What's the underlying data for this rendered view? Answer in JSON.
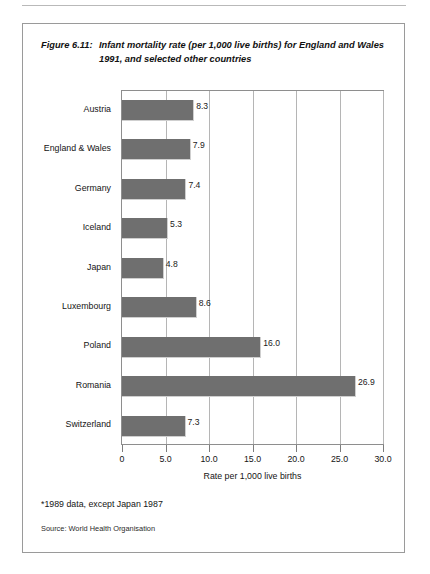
{
  "figure": {
    "number": "Figure 6.11:",
    "title": "Infant mortality rate (per 1,000 live births) for England and Wales 1991, and selected other countries",
    "footnote": "*1989 data, except Japan 1987",
    "source": "Source: World Health Organisation"
  },
  "chart_data": {
    "type": "bar",
    "orientation": "horizontal",
    "title": "Infant mortality rate (per 1,000 live births) for England and Wales 1991, and selected other countries",
    "categories": [
      "Austria",
      "England & Wales",
      "Germany",
      "Iceland",
      "Japan",
      "Luxembourg",
      "Poland",
      "Romania",
      "Switzerland"
    ],
    "values": [
      8.3,
      7.9,
      7.4,
      5.3,
      4.8,
      8.6,
      16.0,
      26.9,
      7.3
    ],
    "value_labels": [
      "8.3",
      "7.9",
      "7.4",
      "5.3",
      "4.8",
      "8.6",
      "16.0",
      "26.9",
      "7.3"
    ],
    "xlabel": "Rate per 1,000 live births",
    "ylabel": "",
    "xlim": [
      0,
      30
    ],
    "xticks": [
      0,
      5,
      10,
      15,
      20,
      25,
      30
    ],
    "xtick_labels": [
      "0",
      "5.0",
      "10.0",
      "15.0",
      "20.0",
      "25.0",
      "30.0"
    ],
    "grid": "vertical",
    "legend": "none",
    "bar_color": "#6f6f6f",
    "plot_border_color": "#8e8e8e",
    "gridline_color": "#b5b5b5"
  }
}
